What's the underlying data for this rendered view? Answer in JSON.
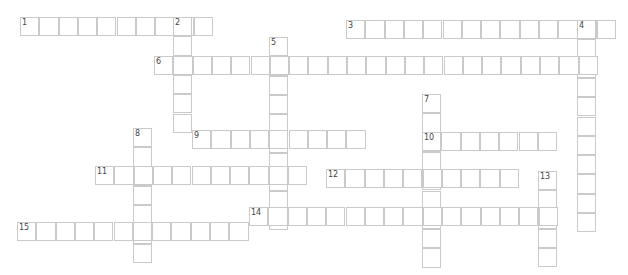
{
  "puzzle": {
    "cell_size": 19.3,
    "border_color": "#cacaca",
    "words": [
      {
        "number": "1",
        "direction": "across",
        "x": 20,
        "y": 17,
        "length": 10
      },
      {
        "number": "2",
        "direction": "down",
        "x": 173,
        "y": 17,
        "length": 6
      },
      {
        "number": "3",
        "direction": "across",
        "x": 346,
        "y": 20,
        "length": 14
      },
      {
        "number": "4",
        "direction": "down",
        "x": 577,
        "y": 20,
        "length": 11
      },
      {
        "number": "5",
        "direction": "down",
        "x": 269,
        "y": 37,
        "length": 10
      },
      {
        "number": "6",
        "direction": "across",
        "x": 154,
        "y": 56,
        "length": 23
      },
      {
        "number": "7",
        "direction": "down",
        "x": 422,
        "y": 94,
        "length": 9
      },
      {
        "number": "8",
        "direction": "down",
        "x": 133,
        "y": 128,
        "length": 7
      },
      {
        "number": "9",
        "direction": "across",
        "x": 192,
        "y": 130,
        "length": 9
      },
      {
        "number": "10",
        "direction": "across",
        "x": 422,
        "y": 132,
        "length": 7
      },
      {
        "number": "11",
        "direction": "across",
        "x": 95,
        "y": 166,
        "length": 11
      },
      {
        "number": "12",
        "direction": "across",
        "x": 326,
        "y": 169,
        "length": 10
      },
      {
        "number": "13",
        "direction": "down",
        "x": 538,
        "y": 171,
        "length": 5
      },
      {
        "number": "14",
        "direction": "across",
        "x": 249,
        "y": 207,
        "length": 16
      },
      {
        "number": "15",
        "direction": "across",
        "x": 17,
        "y": 222,
        "length": 12
      }
    ]
  }
}
